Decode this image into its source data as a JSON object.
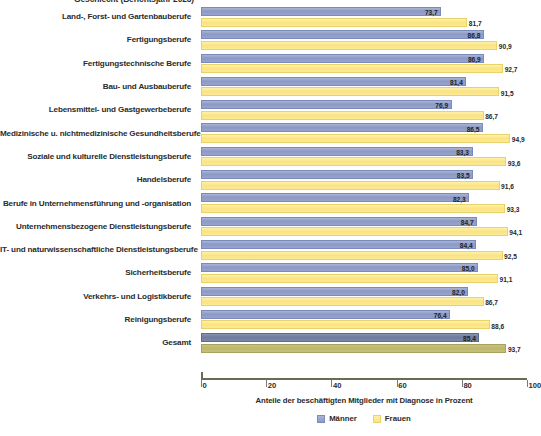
{
  "title_clipped": "Geschlecht (Berichtsjahr 2023)",
  "legend": {
    "position": "bottom-center",
    "items": [
      {
        "label": "Männer",
        "color": "#8b99c6",
        "key": "maenner"
      },
      {
        "label": "Frauen",
        "color": "#fbe384",
        "key": "frauen"
      }
    ]
  },
  "axis": {
    "caption": "Anteile der beschäftigten Mitglieder mit Diagnose in Prozent",
    "ticks": [
      "0",
      "20",
      "40",
      "60",
      "80",
      "100"
    ]
  },
  "chart_data": {
    "type": "bar",
    "orientation": "horizontal",
    "title": "Geschlecht (Berichtsjahr 2023)",
    "xlabel": "Anteile der beschäftigten Mitglieder mit Diagnose in Prozent",
    "ylabel": "",
    "xlim": [
      0,
      100
    ],
    "grid": false,
    "legend_position": "bottom-center",
    "categories": [
      "Land-, Forst- und Gartenbauberufe",
      "Fertigungsberufe",
      "Fertigungstechnische Berufe",
      "Bau- und Ausbauberufe",
      "Lebensmittel- und Gastgewerbeberufe",
      "Medizinische u. nichtmedizinische Gesundheitsberufe",
      "Soziale und kulturelle Dienstleistungsberufe",
      "Handelsberufe",
      "Berufe in Unternehmensführung und -organisation",
      "Unternehmensbezogene Dienstleistungsberufe",
      "IT- und naturwissenschaftliche Dienstleistungsberufe",
      "Sicherheitsberufe",
      "Verkehrs- und Logistikberufe",
      "Reinigungsberufe",
      "Gesamt"
    ],
    "series": [
      {
        "name": "Männer",
        "color": "#8b99c6",
        "values": [
          73.7,
          86.8,
          86.9,
          81.4,
          76.9,
          86.5,
          83.3,
          83.5,
          82.3,
          84.7,
          84.4,
          85.0,
          82.0,
          76.4,
          85.4
        ],
        "labels": [
          "73,7",
          "86,8",
          "86,9",
          "81,4",
          "76,9",
          "86,5",
          "83,3",
          "83,5",
          "82,3",
          "84,7",
          "84,4",
          "85,0",
          "82,0",
          "76,4",
          "85,4"
        ]
      },
      {
        "name": "Frauen",
        "color": "#fbe384",
        "values": [
          81.7,
          90.9,
          92.7,
          91.5,
          86.7,
          94.9,
          93.6,
          91.6,
          93.3,
          94.1,
          92.5,
          91.1,
          86.7,
          88.6,
          93.7
        ],
        "labels": [
          "81,7",
          "90,9",
          "92,7",
          "91,5",
          "86,7",
          "94,9",
          "93,6",
          "91,6",
          "93,3",
          "94,1",
          "92,5",
          "91,1",
          "86,7",
          "88,6",
          "93,7"
        ]
      }
    ]
  }
}
